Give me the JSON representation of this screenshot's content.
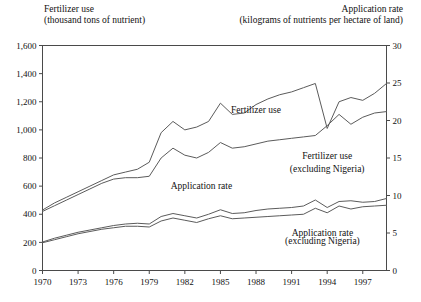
{
  "header": {
    "left_title_line1": "Fertilizer use",
    "left_title_line2": "(thousand tons of nutrient)",
    "right_title_line1": "Application rate",
    "right_title_line2": "(kilograms of nutrients per hectare of land)"
  },
  "chart_data": {
    "type": "line",
    "title": "",
    "xlabel": "",
    "ylabel": "Fertilizer use (thousand tons of nutrient)",
    "y2label": "Application rate (kilograms of nutrients per hectare of land)",
    "xlim": [
      1970,
      1999
    ],
    "ylim": [
      0,
      1600
    ],
    "y2lim": [
      0,
      30
    ],
    "yticks": [
      "0",
      "200",
      "400",
      "600",
      "800",
      "1,000",
      "1,200",
      "1,400",
      "1,600"
    ],
    "ytick_values": [
      0,
      200,
      400,
      600,
      800,
      1000,
      1200,
      1400,
      1600
    ],
    "y2ticks": [
      "0",
      "5",
      "10",
      "15",
      "20",
      "25",
      "30"
    ],
    "y2tick_values": [
      0,
      5,
      10,
      15,
      20,
      25,
      30
    ],
    "xticks": [
      "1970",
      "1973",
      "1976",
      "1979",
      "1982",
      "1985",
      "1988",
      "1991",
      "1994",
      "1997"
    ],
    "xtick_values": [
      1970,
      1973,
      1976,
      1979,
      1982,
      1985,
      1988,
      1991,
      1994,
      1997
    ],
    "grid": false,
    "legend_position": "inline-annotations",
    "x": [
      1970,
      1971,
      1972,
      1973,
      1974,
      1975,
      1976,
      1977,
      1978,
      1979,
      1980,
      1981,
      1982,
      1983,
      1984,
      1985,
      1986,
      1987,
      1988,
      1989,
      1990,
      1991,
      1992,
      1993,
      1994,
      1995,
      1996,
      1997,
      1998,
      1999
    ],
    "series": [
      {
        "name": "Fertilizer use",
        "axis": "left",
        "units": "thousand tons of nutrient",
        "values": [
          430,
          480,
          520,
          560,
          600,
          640,
          680,
          700,
          720,
          770,
          980,
          1060,
          1000,
          1020,
          1060,
          1190,
          1110,
          1120,
          1180,
          1220,
          1250,
          1270,
          1300,
          1330,
          1010,
          1200,
          1230,
          1210,
          1260,
          1330
        ]
      },
      {
        "name": "Fertilizer use (excluding Nigeria)",
        "axis": "left",
        "units": "thousand tons of nutrient",
        "values": [
          420,
          460,
          500,
          540,
          580,
          620,
          650,
          660,
          660,
          670,
          800,
          870,
          820,
          800,
          840,
          910,
          870,
          880,
          900,
          920,
          930,
          940,
          950,
          960,
          1030,
          1110,
          1040,
          1090,
          1120,
          1130
        ]
      },
      {
        "name": "Application rate",
        "axis": "right",
        "units": "kilograms of nutrients per hectare of land",
        "values": [
          3.8,
          4.3,
          4.7,
          5.1,
          5.4,
          5.7,
          6.0,
          6.2,
          6.3,
          6.2,
          7.2,
          7.6,
          7.3,
          7.0,
          7.5,
          8.1,
          7.6,
          7.7,
          8.0,
          8.2,
          8.3,
          8.4,
          8.6,
          9.4,
          8.4,
          9.2,
          9.3,
          9.1,
          9.2,
          9.6
        ]
      },
      {
        "name": "Application rate (excluding Nigeria)",
        "axis": "right",
        "units": "kilograms of nutrients per hectare of land",
        "values": [
          3.7,
          4.1,
          4.5,
          4.9,
          5.2,
          5.5,
          5.7,
          5.9,
          5.9,
          5.8,
          6.6,
          7.0,
          6.7,
          6.4,
          6.9,
          7.3,
          6.9,
          7.0,
          7.1,
          7.2,
          7.3,
          7.4,
          7.5,
          8.3,
          7.7,
          8.6,
          8.2,
          8.5,
          8.6,
          8.7
        ]
      }
    ],
    "annotations": [
      {
        "text": "Fertilizer use",
        "x": 1988.0,
        "y": 1120,
        "axis": "left",
        "anchor": "middle"
      },
      {
        "text": "Fertilizer use",
        "x": 1994.0,
        "y": 790,
        "axis": "left",
        "anchor": "middle"
      },
      {
        "text": "(excluding Nigeria)",
        "x": 1994.0,
        "y": 700,
        "axis": "left",
        "anchor": "middle"
      },
      {
        "text": "Application rate",
        "x": 1983.4,
        "y": 10.9,
        "axis": "right",
        "anchor": "middle"
      },
      {
        "text": "Application rate",
        "x": 1993.6,
        "y": 4.6,
        "axis": "right",
        "anchor": "middle"
      },
      {
        "text": "(excluding Nigeria)",
        "x": 1993.6,
        "y": 3.55,
        "axis": "right",
        "anchor": "middle"
      }
    ]
  }
}
